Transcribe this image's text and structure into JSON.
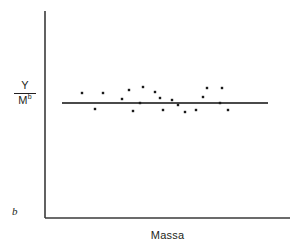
{
  "figure": {
    "background_color": "#ffffff",
    "ink_color": "#231f20",
    "axis_color": "#3a3a3a",
    "line_color": "#4a4a4a",
    "point_color": "#1a1a1a"
  },
  "labels": {
    "y_numerator": "Y",
    "y_denominator_base": "M",
    "y_denominator_exponent": "b",
    "x_axis": "Massa",
    "exponent_marker": "b"
  },
  "axes": {
    "origin_x": 45,
    "origin_y": 218,
    "y_top": 11,
    "x_right": 290,
    "stroke_width": 1.6
  },
  "chart_data": {
    "type": "scatter",
    "title": "",
    "xlabel": "Massa",
    "ylabel": "Y / M^b",
    "grid": false,
    "legend": null,
    "xlim": [
      0,
      1
    ],
    "ylim": [
      0,
      1
    ],
    "axis_ticks": {
      "x": [],
      "y": []
    },
    "fit_line": {
      "kind": "horizontal-regression",
      "slope": 0,
      "y_value": 103,
      "x_start": 62,
      "x_end": 268,
      "stroke_width": 1.8
    },
    "points_px": [
      {
        "x": 82,
        "y": 93
      },
      {
        "x": 103,
        "y": 93
      },
      {
        "x": 95,
        "y": 109
      },
      {
        "x": 122,
        "y": 99
      },
      {
        "x": 129,
        "y": 90
      },
      {
        "x": 133,
        "y": 111
      },
      {
        "x": 143,
        "y": 87
      },
      {
        "x": 140,
        "y": 103
      },
      {
        "x": 155,
        "y": 92
      },
      {
        "x": 160,
        "y": 98
      },
      {
        "x": 163,
        "y": 110
      },
      {
        "x": 172,
        "y": 100
      },
      {
        "x": 178,
        "y": 105
      },
      {
        "x": 185,
        "y": 112
      },
      {
        "x": 196,
        "y": 110
      },
      {
        "x": 203,
        "y": 97
      },
      {
        "x": 207,
        "y": 88
      },
      {
        "x": 222,
        "y": 88
      },
      {
        "x": 220,
        "y": 103
      },
      {
        "x": 228,
        "y": 110
      }
    ],
    "point_count": 20,
    "marker": {
      "shape": "square",
      "size_px": 2.4
    }
  }
}
